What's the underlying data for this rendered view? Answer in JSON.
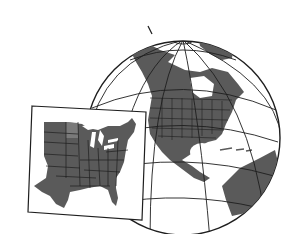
{
  "illustration": {
    "subject": "Globe showing North America with inset map of eastern United States",
    "colors": {
      "background": "#ffffff",
      "land": "#5a5a5a",
      "lines": "#1e1e1e",
      "ocean": "#ffffff",
      "ice": "#f2f2f2"
    }
  }
}
